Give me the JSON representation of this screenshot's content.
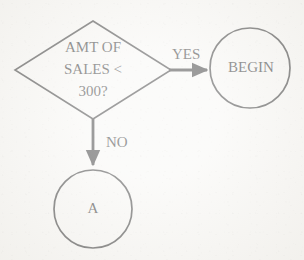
{
  "diagram": {
    "type": "flowchart",
    "canvas": {
      "width": 304,
      "height": 260
    },
    "colors": {
      "background": "#f7f6f3",
      "ink": "#242424",
      "stroke": "#2b2b2b"
    },
    "nodes": [
      {
        "id": "decision-amt-of-sales",
        "shape": "diamond",
        "name": "decision-node",
        "text_lines": [
          "AMT OF",
          "SALES <",
          "300?"
        ],
        "center": {
          "x": 93,
          "y": 70
        },
        "half_width": 78,
        "half_height": 49,
        "font_size": 15
      },
      {
        "id": "terminal-begin",
        "shape": "circle",
        "name": "connector-node-begin",
        "text": "BEGIN",
        "center": {
          "x": 250,
          "y": 68
        },
        "radius": 40,
        "font_size": 15
      },
      {
        "id": "connector-a",
        "shape": "circle",
        "name": "connector-node-a",
        "text": "A",
        "center": {
          "x": 93,
          "y": 209
        },
        "radius": 39,
        "font_size": 15
      }
    ],
    "edges": [
      {
        "id": "edge-yes",
        "name": "yes-branch",
        "label": "YES",
        "from": "decision-amt-of-sales",
        "to": "terminal-begin",
        "direction": "right",
        "start": {
          "x": 168,
          "y": 70
        },
        "end": {
          "x": 211,
          "y": 70
        },
        "label_position": {
          "x": 172,
          "y": 55
        },
        "label_font_size": 15
      },
      {
        "id": "edge-no",
        "name": "no-branch",
        "label": "NO",
        "from": "decision-amt-of-sales",
        "to": "connector-a",
        "direction": "down",
        "start": {
          "x": 93,
          "y": 118
        },
        "end": {
          "x": 93,
          "y": 169
        },
        "label_position": {
          "x": 106,
          "y": 143
        },
        "label_font_size": 15
      }
    ]
  }
}
